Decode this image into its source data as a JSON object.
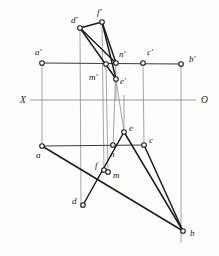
{
  "figure": {
    "kind": "descriptive-geometry-orthographic-projection",
    "background_color": "#fdfdfc",
    "width": 219,
    "height": 256,
    "colors": {
      "bold_stroke": "#1c1c1c",
      "frame_stroke": "#3a3a3a",
      "thin_stroke": "#8e8e8e",
      "node_fill": "#ffffff",
      "label_color": "#1a1a1a"
    }
  },
  "axis": {
    "name": "ground-line-XO",
    "y": 100,
    "x_start": 30,
    "x_end": 196,
    "left_label": "X",
    "right_label": "O",
    "left_label_x": 20,
    "left_label_y": 103,
    "right_label_x": 201,
    "right_label_y": 103
  },
  "points": [
    {
      "id": "a-prime",
      "label": "a'",
      "x": 42,
      "y": 63,
      "lx": 35,
      "ly": 55,
      "plane": "frontal"
    },
    {
      "id": "b-prime",
      "label": "b'",
      "x": 181,
      "y": 64,
      "lx": 189,
      "ly": 62,
      "plane": "frontal"
    },
    {
      "id": "c-prime",
      "label": "c'",
      "x": 143,
      "y": 63,
      "lx": 147,
      "ly": 55,
      "plane": "frontal"
    },
    {
      "id": "d-prime",
      "label": "d'",
      "x": 80,
      "y": 28,
      "lx": 71,
      "ly": 23,
      "plane": "frontal"
    },
    {
      "id": "e-prime",
      "label": "e'",
      "x": 116,
      "y": 79,
      "lx": 120,
      "ly": 84,
      "plane": "frontal"
    },
    {
      "id": "f-prime",
      "label": "f'",
      "x": 102,
      "y": 22,
      "lx": 97,
      "ly": 15,
      "plane": "frontal"
    },
    {
      "id": "m-prime",
      "label": "m'",
      "x": 106,
      "y": 64,
      "lx": 89,
      "ly": 80,
      "plane": "frontal"
    },
    {
      "id": "n-prime",
      "label": "n'",
      "x": 116,
      "y": 63,
      "lx": 119,
      "ly": 57,
      "plane": "frontal"
    },
    {
      "id": "a",
      "label": "a",
      "x": 42,
      "y": 146,
      "lx": 36,
      "ly": 158,
      "plane": "horizontal"
    },
    {
      "id": "b",
      "label": "b",
      "x": 183,
      "y": 231,
      "lx": 190,
      "ly": 236,
      "plane": "horizontal"
    },
    {
      "id": "c",
      "label": "c",
      "x": 144,
      "y": 145,
      "lx": 149,
      "ly": 143,
      "plane": "horizontal"
    },
    {
      "id": "d",
      "label": "d",
      "x": 83,
      "y": 205,
      "lx": 72,
      "ly": 204,
      "plane": "horizontal"
    },
    {
      "id": "e",
      "label": "e",
      "x": 124,
      "y": 132,
      "lx": 129,
      "ly": 131,
      "plane": "horizontal"
    },
    {
      "id": "f",
      "label": "f",
      "x": 104,
      "y": 170,
      "lx": 95,
      "ly": 168,
      "plane": "horizontal"
    },
    {
      "id": "m",
      "label": "m",
      "x": 108,
      "y": 172,
      "lx": 113,
      "ly": 178,
      "plane": "horizontal"
    },
    {
      "id": "n",
      "label": "n",
      "x": 113,
      "y": 145,
      "lx": 110,
      "ly": 157,
      "plane": "horizontal"
    }
  ],
  "bold_segments": [
    {
      "name": "seg-d-prime-f-prime",
      "x1": 80,
      "y1": 28,
      "x2": 102,
      "y2": 22
    },
    {
      "name": "seg-d-prime-n-prime",
      "x1": 80,
      "y1": 28,
      "x2": 116,
      "y2": 63
    },
    {
      "name": "seg-d-prime-e-prime",
      "x1": 80,
      "y1": 28,
      "x2": 116,
      "y2": 79
    },
    {
      "name": "seg-f-prime-e-prime",
      "x1": 102,
      "y1": 22,
      "x2": 116,
      "y2": 79
    },
    {
      "name": "seg-f-prime-n-prime",
      "x1": 102,
      "y1": 22,
      "x2": 116,
      "y2": 63
    },
    {
      "name": "seg-a-b",
      "x1": 42,
      "y1": 146,
      "x2": 183,
      "y2": 231
    },
    {
      "name": "seg-c-b",
      "x1": 144,
      "y1": 145,
      "x2": 183,
      "y2": 231
    },
    {
      "name": "seg-e-b",
      "x1": 124,
      "y1": 132,
      "x2": 183,
      "y2": 231
    },
    {
      "name": "seg-d-e",
      "x1": 83,
      "y1": 205,
      "x2": 124,
      "y2": 132
    }
  ],
  "frame_segments": [
    {
      "name": "line-a-prime-b-prime",
      "x1": 42,
      "y1": 63,
      "x2": 181,
      "y2": 64
    },
    {
      "name": "line-a-c",
      "x1": 42,
      "y1": 146,
      "x2": 144,
      "y2": 145
    }
  ],
  "projector_lines": [
    {
      "name": "projector-a",
      "x1": 42,
      "y1": 63,
      "x2": 42,
      "y2": 146
    },
    {
      "name": "projector-b",
      "x1": 181,
      "y1": 64,
      "x2": 181,
      "y2": 243
    },
    {
      "name": "projector-c",
      "x1": 143,
      "y1": 63,
      "x2": 144,
      "y2": 145
    },
    {
      "name": "projector-d",
      "x1": 80,
      "y1": 28,
      "x2": 81,
      "y2": 208
    },
    {
      "name": "projector-e",
      "x1": 116,
      "y1": 79,
      "x2": 124,
      "y2": 132
    },
    {
      "name": "projector-f",
      "x1": 102,
      "y1": 22,
      "x2": 104,
      "y2": 172
    },
    {
      "name": "projector-m",
      "x1": 106,
      "y1": 64,
      "x2": 108,
      "y2": 174
    },
    {
      "name": "projector-n",
      "x1": 116,
      "y1": 63,
      "x2": 113,
      "y2": 147
    },
    {
      "name": "projector-e-vert",
      "x1": 124,
      "y1": 95,
      "x2": 124,
      "y2": 132
    }
  ],
  "extra_thin_segments": [
    {
      "name": "thin-e-prime-drop",
      "x1": 116,
      "y1": 79,
      "x2": 116,
      "y2": 100
    }
  ]
}
